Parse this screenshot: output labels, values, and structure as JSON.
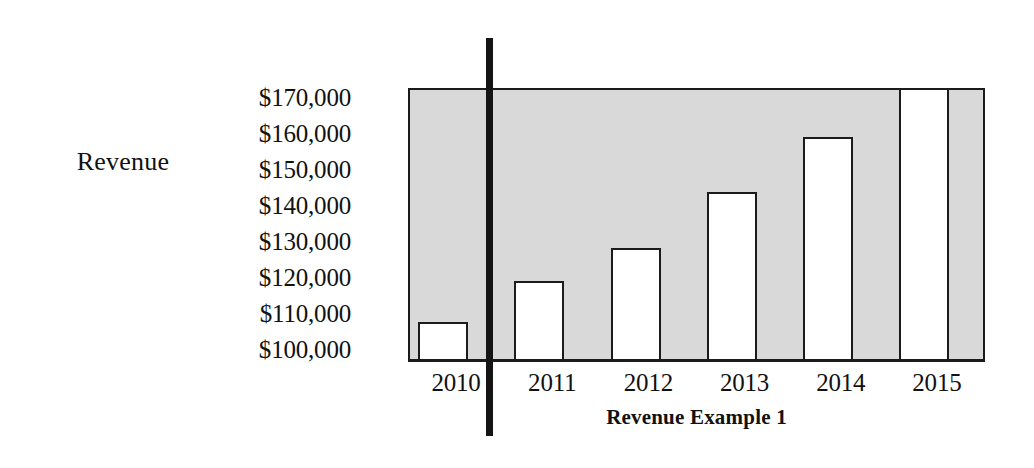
{
  "chart_data": {
    "type": "bar",
    "title": "Revenue Example 1",
    "xlabel": "",
    "ylabel": "Revenue",
    "categories": [
      "2010",
      "2011",
      "2012",
      "2013",
      "2014",
      "2015"
    ],
    "values": [
      106000,
      117000,
      126000,
      141000,
      156000,
      175000
    ],
    "value_labels": [
      "$106,000",
      "$117,000",
      "$126,000",
      "$141,000",
      "$156,000",
      "$175,000"
    ],
    "ytick_labels": [
      "$170,000",
      "$160,000",
      "$150,000",
      "$140,000",
      "$130,000",
      "$120,000",
      "$110,000",
      "$100,000"
    ],
    "ytick_values": [
      170000,
      160000,
      150000,
      140000,
      130000,
      120000,
      110000,
      100000
    ],
    "ylim": [
      96000,
      170000
    ],
    "grid": false,
    "legend": "none",
    "notes": [
      "2015 bar is clipped at the top of the plot frame (value exceeds the $170,000 axis maximum)."
    ],
    "annotations": [
      {
        "name": "vertical-divider-line",
        "orientation": "vertical",
        "between_categories": [
          "2010",
          "2011"
        ],
        "color": "#141414"
      }
    ],
    "colors": {
      "plot_background": "#d9d9d9",
      "bar_fill": "#ffffff",
      "bar_outline": "#1b1b1b",
      "axis": "#1b1b1b",
      "text": "#111111",
      "annotation_line": "#141414"
    }
  }
}
